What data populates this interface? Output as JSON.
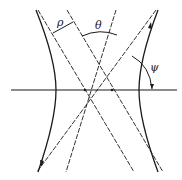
{
  "diagram": {
    "title": "",
    "labels": {
      "rho": "ρ",
      "theta": "θ",
      "psi": "ψ"
    },
    "colors": {
      "stroke": "#1a1a1a",
      "background": "#ffffff"
    },
    "elements": {
      "horizontal_axis": {
        "y": 90,
        "x1": 11,
        "x2": 177
      },
      "left_hyperbola": {
        "vertex_x": 56
      },
      "right_hyperbola": {
        "vertex_x": 139
      },
      "asymptote_intersections_x": [
        85,
        112
      ]
    }
  }
}
